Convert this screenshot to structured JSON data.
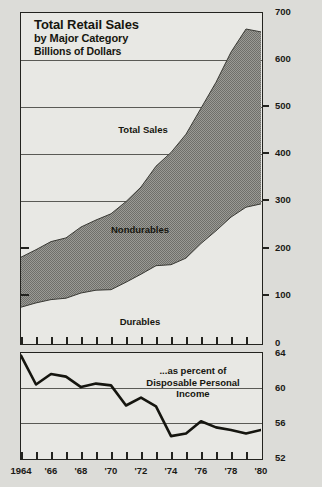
{
  "figure": {
    "background_color": "#dcdcd8",
    "panel_color": "#e8e8e4",
    "ink_color": "#23231f",
    "fill_color": "#8e8e8a"
  },
  "title": {
    "line1": "Total Retail Sales",
    "line2": "by Major Category",
    "line3": "Billions of Dollars"
  },
  "annotations": {
    "total_sales": "Total Sales",
    "nondurables": "Nondurables",
    "durables": "Durables",
    "pct_line1": "...as percent of",
    "pct_line2": "Disposable Personal",
    "pct_line3": "Income"
  },
  "axes": {
    "top_y_ticks": [
      "700",
      "600",
      "500",
      "400",
      "300",
      "200",
      "100",
      "0"
    ],
    "bottom_y_ticks": [
      "64",
      "60",
      "56",
      "52"
    ],
    "x_ticks": [
      "1964",
      "'66",
      "'68",
      "'70",
      "'72",
      "'74",
      "'76",
      "'78",
      "'80"
    ]
  },
  "chart_data": [
    {
      "type": "area",
      "title": "Total Retail Sales by Major Category",
      "subtitle": "Billions of Dollars",
      "xlabel": "",
      "ylabel": "Billions of Dollars",
      "stacked": true,
      "grid": true,
      "legend": "in-plot labels",
      "xlim": [
        1964,
        1980
      ],
      "ylim": [
        0,
        700
      ],
      "yticks": [
        0,
        100,
        200,
        300,
        400,
        500,
        600,
        700
      ],
      "xticks": [
        1964,
        1966,
        1968,
        1970,
        1972,
        1974,
        1976,
        1978,
        1980
      ],
      "xticklabels": [
        "1964",
        "'66",
        "'68",
        "'70",
        "'72",
        "'74",
        "'76",
        "'78",
        "'80"
      ],
      "x": [
        1964,
        1965,
        1966,
        1967,
        1968,
        1969,
        1970,
        1971,
        1972,
        1973,
        1974,
        1975,
        1976,
        1977,
        1978,
        1979,
        1980
      ],
      "series": [
        {
          "name": "Durables",
          "fill": "white",
          "values": [
            76,
            85,
            92,
            95,
            106,
            112,
            113,
            129,
            146,
            164,
            166,
            180,
            211,
            238,
            267,
            288,
            295
          ]
        },
        {
          "name": "Nondurables",
          "fill": "gray",
          "values": [
            106,
            113,
            123,
            128,
            140,
            149,
            161,
            171,
            185,
            211,
            238,
            263,
            287,
            315,
            350,
            378,
            365
          ]
        }
      ],
      "total": {
        "name": "Total Sales",
        "values": [
          182,
          198,
          215,
          223,
          246,
          261,
          274,
          300,
          331,
          375,
          404,
          443,
          498,
          553,
          617,
          666,
          660
        ]
      }
    },
    {
      "type": "line",
      "title": "...as percent of Disposable Personal Income",
      "xlabel": "",
      "ylabel": "Percent",
      "grid": true,
      "xlim": [
        1964,
        1980
      ],
      "ylim": [
        52,
        64
      ],
      "yticks": [
        52,
        56,
        60,
        64
      ],
      "xticks": [
        1964,
        1966,
        1968,
        1970,
        1972,
        1974,
        1976,
        1978,
        1980
      ],
      "xticklabels": [
        "1964",
        "'66",
        "'68",
        "'70",
        "'72",
        "'74",
        "'76",
        "'78",
        "'80"
      ],
      "x": [
        1964,
        1965,
        1966,
        1967,
        1968,
        1969,
        1970,
        1971,
        1972,
        1973,
        1974,
        1975,
        1976,
        1977,
        1978,
        1979,
        1980
      ],
      "series": [
        {
          "name": "Retail sales as percent of disposable personal income",
          "values": [
            63.7,
            60.4,
            61.6,
            61.3,
            60.1,
            60.5,
            60.3,
            58.0,
            58.9,
            57.9,
            54.5,
            54.8,
            56.2,
            55.5,
            55.2,
            54.8,
            55.2
          ]
        }
      ]
    }
  ]
}
